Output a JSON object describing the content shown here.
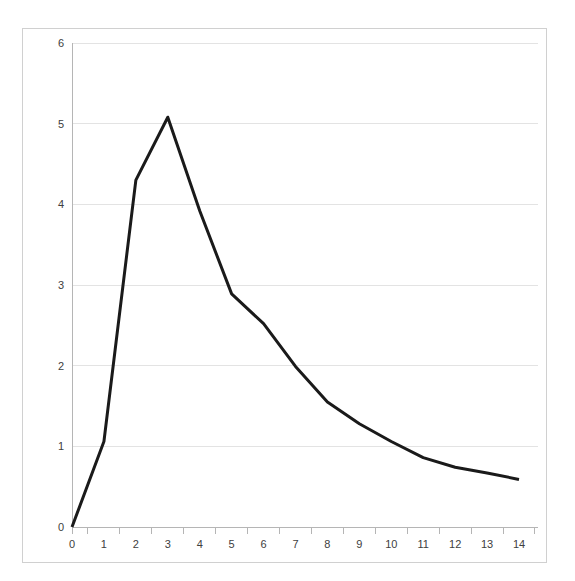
{
  "chart_data": {
    "type": "line",
    "title": "",
    "subtitle": "",
    "xlabel": "",
    "ylabel": "",
    "x": [
      0,
      1,
      2,
      3,
      4,
      5,
      6,
      7,
      8,
      9,
      10,
      11,
      12,
      13,
      14
    ],
    "values": [
      0,
      1.06,
      4.3,
      5.08,
      3.92,
      2.89,
      2.52,
      1.99,
      1.55,
      1.28,
      1.06,
      0.86,
      0.74,
      0.67,
      0.59
    ],
    "series": [
      {
        "name": "",
        "values": [
          0,
          1.06,
          4.3,
          5.08,
          3.92,
          2.89,
          2.52,
          1.99,
          1.55,
          1.28,
          1.06,
          0.86,
          0.74,
          0.67,
          0.59
        ]
      }
    ],
    "xlim": [
      0,
      14
    ],
    "ylim": [
      0,
      6
    ],
    "x_tick_labels": [
      "0",
      "1",
      "2",
      "3",
      "4",
      "5",
      "6",
      "7",
      "8",
      "9",
      "10",
      "11",
      "12",
      "13",
      "14"
    ],
    "y_tick_labels": [
      "0",
      "1",
      "2",
      "3",
      "4",
      "5",
      "6"
    ],
    "y_ticks": [
      0,
      1,
      2,
      3,
      4,
      5,
      6
    ],
    "grid": "horizontal",
    "legend": "none",
    "annotations": [],
    "colors": {
      "line": "#1a1a1a",
      "grid": "#e3e3e3",
      "axis": "#b5b5b5",
      "frame": "#d0d0d0",
      "tick_text": "#404040",
      "background": "#ffffff"
    },
    "line_width": 3
  }
}
